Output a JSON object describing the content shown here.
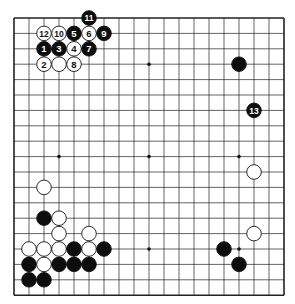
{
  "board": {
    "size": 19,
    "origin_x": 14,
    "origin_y": 18,
    "step_x": 15.0,
    "step_y": 15.4,
    "line_color": "#222222",
    "star_points": [
      [
        9,
        3
      ],
      [
        3,
        9
      ],
      [
        9,
        9
      ],
      [
        15,
        9
      ],
      [
        9,
        15
      ],
      [
        15,
        15
      ],
      [
        3,
        3
      ],
      [
        15,
        3
      ],
      [
        3,
        15
      ]
    ],
    "stones": [
      {
        "col": 5,
        "row": 0,
        "color": "black",
        "label": "11"
      },
      {
        "col": 2,
        "row": 1,
        "color": "white",
        "label": "12"
      },
      {
        "col": 3,
        "row": 1,
        "color": "white",
        "label": "10"
      },
      {
        "col": 4,
        "row": 1,
        "color": "black",
        "label": "5"
      },
      {
        "col": 5,
        "row": 1,
        "color": "white",
        "label": "6"
      },
      {
        "col": 6,
        "row": 1,
        "color": "black",
        "label": "9"
      },
      {
        "col": 2,
        "row": 2,
        "color": "black",
        "label": "1"
      },
      {
        "col": 3,
        "row": 2,
        "color": "black",
        "label": "3"
      },
      {
        "col": 4,
        "row": 2,
        "color": "white",
        "label": "4"
      },
      {
        "col": 5,
        "row": 2,
        "color": "black",
        "label": "7"
      },
      {
        "col": 2,
        "row": 3,
        "color": "white",
        "label": "2"
      },
      {
        "col": 3,
        "row": 3,
        "color": "white",
        "label": ""
      },
      {
        "col": 4,
        "row": 3,
        "color": "white",
        "label": "8"
      },
      {
        "col": 15,
        "row": 3,
        "color": "black",
        "label": ""
      },
      {
        "col": 16,
        "row": 6,
        "color": "black",
        "label": "13"
      },
      {
        "col": 16,
        "row": 10,
        "color": "white",
        "label": ""
      },
      {
        "col": 2,
        "row": 11,
        "color": "white",
        "label": ""
      },
      {
        "col": 2,
        "row": 13,
        "color": "black",
        "label": ""
      },
      {
        "col": 3,
        "row": 13,
        "color": "white",
        "label": ""
      },
      {
        "col": 3,
        "row": 14,
        "color": "white",
        "label": ""
      },
      {
        "col": 5,
        "row": 14,
        "color": "white",
        "label": ""
      },
      {
        "col": 16,
        "row": 14,
        "color": "white",
        "label": ""
      },
      {
        "col": 1,
        "row": 15,
        "color": "white",
        "label": ""
      },
      {
        "col": 2,
        "row": 15,
        "color": "white",
        "label": ""
      },
      {
        "col": 3,
        "row": 15,
        "color": "white",
        "label": ""
      },
      {
        "col": 4,
        "row": 15,
        "color": "black",
        "label": ""
      },
      {
        "col": 5,
        "row": 15,
        "color": "white",
        "label": ""
      },
      {
        "col": 6,
        "row": 15,
        "color": "black",
        "label": ""
      },
      {
        "col": 14,
        "row": 15,
        "color": "black",
        "label": ""
      },
      {
        "col": 1,
        "row": 16,
        "color": "black",
        "label": ""
      },
      {
        "col": 2,
        "row": 16,
        "color": "white",
        "label": ""
      },
      {
        "col": 3,
        "row": 16,
        "color": "black",
        "label": ""
      },
      {
        "col": 4,
        "row": 16,
        "color": "black",
        "label": ""
      },
      {
        "col": 5,
        "row": 16,
        "color": "black",
        "label": ""
      },
      {
        "col": 15,
        "row": 16,
        "color": "black",
        "label": ""
      },
      {
        "col": 1,
        "row": 17,
        "color": "black",
        "label": ""
      },
      {
        "col": 2,
        "row": 17,
        "color": "black",
        "label": ""
      }
    ]
  }
}
